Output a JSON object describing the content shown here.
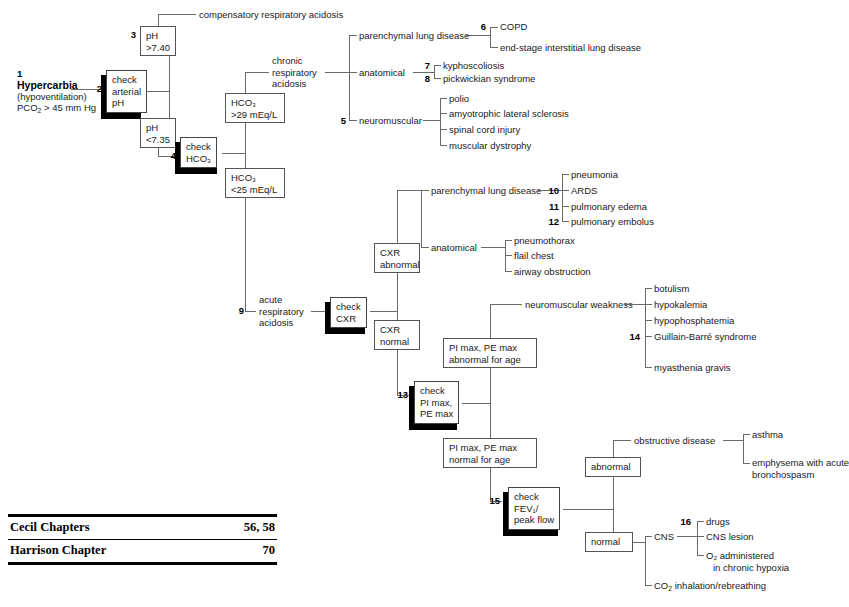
{
  "diagram": {
    "root": {
      "number": "1",
      "title": "Hypercarbia",
      "line2": "(hypoventilation)",
      "line3_html": "PCO<sub>2</sub> > 45 mm Hg"
    },
    "actions": {
      "check_arterial_ph": {
        "number": "2",
        "lines": [
          "check",
          "arterial",
          "pH"
        ]
      },
      "check_hco3": {
        "number": "4",
        "lines": [
          "check",
          "HCO₃"
        ]
      },
      "check_cxr": {
        "number": "9",
        "lines": [
          "check",
          "CXR"
        ]
      },
      "check_pimax_pemax": {
        "number": "13",
        "lines": [
          "check",
          "PI max,",
          "PE max"
        ]
      },
      "check_fev1": {
        "number": "15",
        "lines": [
          "check",
          "FEV₁/",
          "peak flow"
        ]
      }
    },
    "nodes": {
      "ph_high": {
        "lines": [
          "pH",
          ">7.40"
        ],
        "number": "3"
      },
      "ph_low": {
        "lines": [
          "pH",
          "<7.35"
        ]
      },
      "hco3_high": {
        "lines": [
          "HCO₃",
          ">29 mEq/L"
        ]
      },
      "hco3_low": {
        "lines": [
          "HCO₃",
          "<25 mEq/L"
        ]
      },
      "cxr_abnormal": {
        "lines": [
          "CXR",
          "abnormal"
        ]
      },
      "cxr_normal": {
        "lines": [
          "CXR",
          "normal"
        ]
      },
      "pimax_abnormal": {
        "lines": [
          "PI max, PE max",
          "abnormal for age"
        ]
      },
      "pimax_normal": {
        "lines": [
          "PI max, PE max",
          "normal for age"
        ]
      },
      "fev1_abnormal": {
        "lines": [
          "abnormal"
        ]
      },
      "fev1_normal": {
        "lines": [
          "normal"
        ]
      }
    },
    "labels": {
      "compensatory_respiratory_acidosis": "compensatory respiratory acidosis",
      "chronic_respiratory_acidosis": [
        "chronic",
        "respiratory",
        "acidosis"
      ],
      "acute_respiratory_acidosis": [
        "acute",
        "respiratory",
        "acidosis"
      ],
      "chronic_parenchymal": "parenchymal lung disease",
      "chronic_anatomical": "anatomical",
      "chronic_neuromuscular": "neuromuscular",
      "acute_parenchymal": "parenchymal lung disease",
      "acute_anatomical": "anatomical",
      "neuromuscular_weakness": "neuromuscular weakness",
      "obstructive_disease": "obstructive disease",
      "cns": "CNS",
      "co2_rebreathing_html": "CO<sub>2</sub> inhalation/rebreathing"
    },
    "leaves": {
      "chronic_parenchymal": [
        {
          "number": "6",
          "text": "COPD"
        },
        {
          "number": "",
          "text": "end-stage interstitial lung disease"
        }
      ],
      "chronic_anatomical": [
        {
          "number": "7",
          "text": "kyphoscoliosis"
        },
        {
          "number": "8",
          "text": "pickwickian syndrome"
        }
      ],
      "chronic_neuromuscular": [
        {
          "number": "5",
          "text": "polio"
        },
        {
          "number": "",
          "text": "amyotrophic lateral sclerosis"
        },
        {
          "number": "",
          "text": "spinal cord injury"
        },
        {
          "number": "",
          "text": "muscular dystrophy"
        }
      ],
      "acute_parenchymal": [
        {
          "number": "",
          "text": "pneumonia"
        },
        {
          "number": "10",
          "text": "ARDS"
        },
        {
          "number": "11",
          "text": "pulmonary edema"
        },
        {
          "number": "12",
          "text": "pulmonary embolus"
        }
      ],
      "acute_anatomical": [
        {
          "number": "",
          "text": "pneumothorax"
        },
        {
          "number": "",
          "text": "flail chest"
        },
        {
          "number": "",
          "text": "airway obstruction"
        }
      ],
      "neuromuscular_weakness": [
        {
          "number": "",
          "text": "botulism"
        },
        {
          "number": "",
          "text": "hypokalemia"
        },
        {
          "number": "",
          "text": "hypophosphatemia"
        },
        {
          "number": "14",
          "text": "Guillain-Barré syndrome"
        },
        {
          "number": "",
          "text": "myasthenia gravis"
        }
      ],
      "obstructive_disease": [
        {
          "number": "",
          "text": "asthma"
        },
        {
          "number": "",
          "text": "emphysema with acute",
          "text2": "bronchospasm"
        }
      ],
      "cns": [
        {
          "number": "16",
          "text": "drugs"
        },
        {
          "number": "",
          "text": "CNS lesion"
        },
        {
          "number": "",
          "text": "O₂ administered",
          "text2": "in chronic hypoxia"
        }
      ]
    }
  },
  "reference_table": {
    "rows": [
      {
        "label": "Cecil Chapters",
        "value": "56, 58"
      },
      {
        "label": "Harrison Chapter",
        "value": "70"
      }
    ]
  }
}
